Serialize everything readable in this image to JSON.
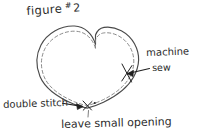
{
  "page": {
    "background_color": "#ffffff",
    "ink_color": "#2b2b2b",
    "outline_color": "#4a4a4a",
    "stitch_color": "#7d7d7d"
  },
  "title": {
    "word": "figure",
    "hash": "#",
    "number": "2"
  },
  "diagram": {
    "shape_name": "heart",
    "outline_style": "solid hand-drawn",
    "stitch_line_style": "dashed"
  },
  "annotations": {
    "machine": "machine",
    "sew": "sew",
    "double_stitch": "double stitch",
    "leave_opening": "leave small opening"
  }
}
